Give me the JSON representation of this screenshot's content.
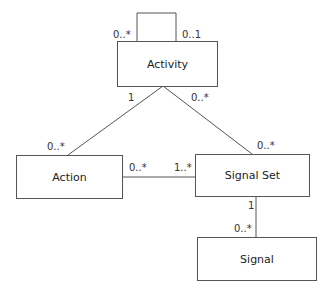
{
  "classes": {
    "activity": "Activity",
    "action": "Action",
    "signal_set": "Signal Set",
    "signal": "Signal"
  },
  "associations": {
    "activity_self": {
      "left": "0..*",
      "right": "0..1"
    },
    "activity_action": {
      "activity_end": "1",
      "action_end": "0..*"
    },
    "activity_signal_set": {
      "activity_end": "0..*",
      "signal_set_end": "0..*"
    },
    "action_signal_set": {
      "action_end": "0..*",
      "signal_set_end": "1..*"
    },
    "signal_set_signal": {
      "signal_set_end": "1",
      "signal_end": "0..*"
    }
  },
  "colors": {
    "line": "#555555",
    "text": "#222222",
    "background": "#ffffff"
  }
}
